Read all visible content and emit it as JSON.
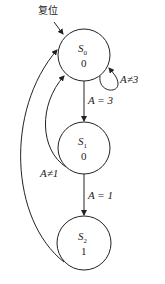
{
  "reset_label": "复位",
  "states": [
    {
      "name": "S",
      "sub": "0",
      "output": "0"
    },
    {
      "name": "S",
      "sub": "1",
      "output": "0"
    },
    {
      "name": "S",
      "sub": "2",
      "output": "1"
    }
  ],
  "transitions": {
    "s0_self": "A≠3",
    "s0_to_s1": "A = 3",
    "s1_to_s0": "A≠1",
    "s1_to_s2": "A = 1"
  },
  "colors": {
    "stroke": "#222222",
    "background": "#ffffff"
  }
}
